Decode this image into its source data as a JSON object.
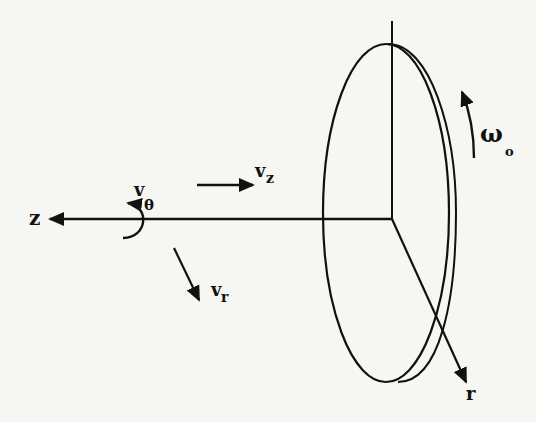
{
  "figure": {
    "stroke_color": "#111111",
    "background_color": "#f6f6f3"
  },
  "labels": {
    "z_axis": "z",
    "r_axis": "r",
    "v_theta_base": "v",
    "v_theta_sub": "θ",
    "v_z_base": "v",
    "v_z_sub": "z",
    "v_r_base": "v",
    "v_r_sub": "r",
    "omega_base": "ω",
    "omega_sub": "o"
  }
}
